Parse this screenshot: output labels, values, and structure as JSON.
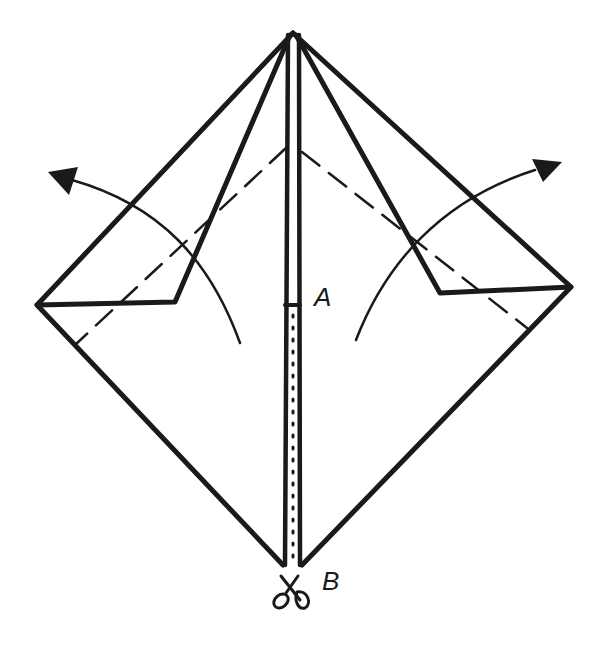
{
  "diagram": {
    "type": "origami-fold-instruction",
    "ink_color": "#1a1a1a",
    "background": "#ffffff",
    "labels": {
      "point_a": "A",
      "point_b": "B"
    },
    "symbols": {
      "cut": "scissors-icon",
      "fold_left": "curved-arrow-left",
      "fold_right": "curved-arrow-right"
    },
    "lines": {
      "outline": "solid",
      "fold_guide": "dashed",
      "cut_line": "dotted"
    }
  }
}
